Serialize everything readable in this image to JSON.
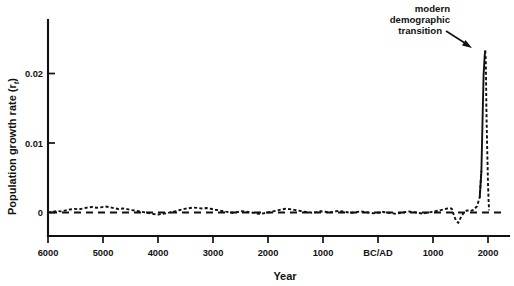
{
  "chart_data": {
    "type": "line",
    "title": "",
    "xlabel": "Year",
    "ylabel": "Population growth rate (r",
    "ylabel_sub": "t",
    "ylabel_suffix": ")",
    "ylabel_full": "Population growth rate (r_t)",
    "xtick_labels": [
      "6000",
      "5000",
      "4000",
      "3000",
      "2000",
      "1000",
      "BC/AD",
      "1000",
      "2000"
    ],
    "xtick_years": [
      -6000,
      -5000,
      -4000,
      -3000,
      -2000,
      -1000,
      0,
      1000,
      2000
    ],
    "ytick_labels": [
      "0",
      "0.01",
      "0.02"
    ],
    "ytick_values": [
      0,
      0.01,
      0.02
    ],
    "xlim": [
      -6000,
      2500
    ],
    "ylim": [
      -0.0027,
      0.0272
    ],
    "grid": false,
    "legend": null,
    "reference_line": {
      "y": 0,
      "style": "dashed",
      "label": "zero growth"
    },
    "annotations": [
      {
        "text_lines": [
          "modern",
          "demographic",
          "transition"
        ],
        "text": "modern demographic transition",
        "arrow_from_year": -400,
        "arrow_from_value": 0.0262,
        "arrow_to_year": 1830,
        "arrow_to_value": 0.0238
      }
    ],
    "series": [
      {
        "name": "Population growth rate",
        "style": "dotted",
        "x": [
          -6000,
          -5920,
          -5840,
          -5760,
          -5680,
          -5600,
          -5520,
          -5440,
          -5360,
          -5280,
          -5200,
          -5120,
          -5040,
          -4960,
          -4880,
          -4800,
          -4720,
          -4640,
          -4560,
          -4480,
          -4400,
          -4320,
          -4240,
          -4160,
          -4080,
          -4000,
          -3920,
          -3840,
          -3760,
          -3680,
          -3600,
          -3520,
          -3440,
          -3360,
          -3280,
          -3200,
          -3120,
          -3040,
          -2960,
          -2880,
          -2800,
          -2720,
          -2640,
          -2560,
          -2480,
          -2400,
          -2320,
          -2240,
          -2160,
          -2080,
          -2000,
          -1920,
          -1840,
          -1760,
          -1680,
          -1600,
          -1520,
          -1440,
          -1360,
          -1280,
          -1200,
          -1120,
          -1040,
          -960,
          -880,
          -800,
          -720,
          -640,
          -560,
          -480,
          -400,
          -320,
          -240,
          -160,
          -80,
          0,
          80,
          160,
          240,
          320,
          400,
          480,
          560,
          640,
          720,
          800,
          880,
          960,
          1040,
          1120,
          1200,
          1260,
          1300,
          1340,
          1380,
          1420,
          1460,
          1500,
          1560,
          1620,
          1680,
          1740,
          1800,
          1850,
          1880,
          1900,
          1920,
          1940,
          1950,
          1960,
          1965,
          1970,
          1980,
          1990,
          2000,
          2010,
          2020
        ],
        "y": [
          0.0,
          0.0001,
          0.00022,
          0.00016,
          0.0003,
          0.00044,
          0.00052,
          0.00046,
          0.00058,
          0.00072,
          0.0008,
          0.00068,
          0.00074,
          0.00086,
          0.00078,
          0.00062,
          0.0005,
          0.00058,
          0.00048,
          0.00034,
          0.00026,
          0.00014,
          2e-05,
          -0.0001,
          -0.00022,
          -0.00028,
          -0.0002,
          -0.0001,
          6e-05,
          0.0002,
          0.00036,
          0.00052,
          0.00062,
          0.00072,
          0.00066,
          0.00058,
          0.00064,
          0.00054,
          0.0004,
          0.0003,
          0.00016,
          6e-05,
          -4e-05,
          6e-05,
          0.00018,
          0.00012,
          2e-05,
          -8e-05,
          -0.0002,
          -0.00012,
          0.0,
          0.00014,
          0.00028,
          0.00042,
          0.00054,
          0.00048,
          0.00038,
          0.00026,
          0.00014,
          6e-05,
          -4e-05,
          6e-05,
          0.00018,
          0.0001,
          0.0,
          0.00012,
          0.00024,
          0.00014,
          4e-05,
          -6e-05,
          4e-05,
          0.00016,
          8e-05,
          -2e-05,
          -0.00012,
          -4e-05,
          8e-05,
          0.0,
          -0.0001,
          -0.00018,
          -8e-05,
          4e-05,
          0.00014,
          6e-05,
          -4e-05,
          -0.00014,
          -6e-05,
          6e-05,
          0.00018,
          0.0003,
          0.00044,
          0.00058,
          0.00064,
          0.00056,
          -0.0004,
          -0.0012,
          -0.0015,
          -0.0008,
          0.0,
          0.0003,
          0.0002,
          0.0004,
          0.0009,
          0.0022,
          0.006,
          0.013,
          0.0198,
          0.0226,
          0.0233,
          0.0218,
          0.019,
          0.0152,
          0.0112,
          0.0076,
          0.0042,
          0.0018,
          0.0003
        ],
        "peak": {
          "year": 1950,
          "value": 0.0233
        },
        "trough": {
          "year": 1460,
          "value": -0.0015
        }
      }
    ]
  }
}
